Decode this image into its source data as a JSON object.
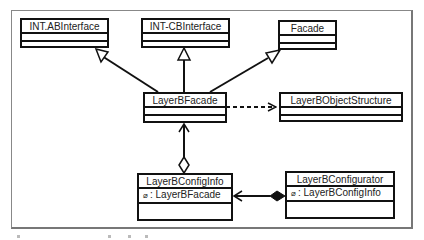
{
  "diagram": {
    "type": "UML class diagram",
    "classes": [
      {
        "id": "int-ab",
        "name": "INT.ABInterface",
        "attributes": []
      },
      {
        "id": "int-cb",
        "name": "INT-CBInterface",
        "attributes": []
      },
      {
        "id": "facade",
        "name": "Facade",
        "attributes": []
      },
      {
        "id": "layerb-facade",
        "name": "LayerBFacade",
        "attributes": []
      },
      {
        "id": "layerb-object-structure",
        "name": "LayerBObjectStructure",
        "attributes": []
      },
      {
        "id": "layerb-config-info",
        "name": "LayerBConfigInfo",
        "attributes": [
          {
            "visibility": "⌀",
            "text": ": LayerBFacade"
          }
        ]
      },
      {
        "id": "layerb-configurator",
        "name": "LayerBConfigurator",
        "attributes": [
          {
            "visibility": "⌀",
            "text": ": LayerBConfigInfo"
          }
        ]
      }
    ],
    "relationships": [
      {
        "from": "LayerBFacade",
        "to": "INT.ABInterface",
        "kind": "generalization"
      },
      {
        "from": "LayerBFacade",
        "to": "INT-CBInterface",
        "kind": "generalization"
      },
      {
        "from": "LayerBFacade",
        "to": "Facade",
        "kind": "generalization"
      },
      {
        "from": "LayerBFacade",
        "to": "LayerBObjectStructure",
        "kind": "dependency"
      },
      {
        "from": "LayerBConfigInfo",
        "to": "LayerBFacade",
        "kind": "aggregation"
      },
      {
        "from": "LayerBConfigurator",
        "to": "LayerBConfigInfo",
        "kind": "composition"
      }
    ]
  }
}
